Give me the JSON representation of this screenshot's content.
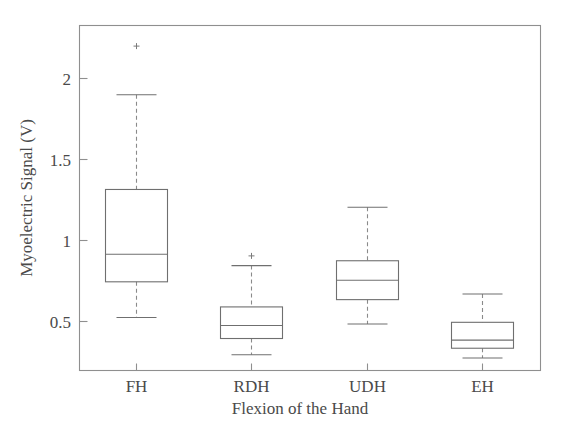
{
  "chart_data": {
    "type": "box",
    "title": "",
    "xlabel": "Flexion of the Hand",
    "ylabel": "Myoelectric Signal (V)",
    "categories": [
      "FH",
      "RDH",
      "UDH",
      "EH"
    ],
    "ytick_labels": [
      "0.5",
      "1",
      "1.5",
      "2"
    ],
    "ytick_values": [
      0.5,
      1,
      1.5,
      2
    ],
    "ylim": [
      0.2,
      2.33
    ],
    "grid": false,
    "legend": null,
    "boxes": [
      {
        "category": "FH",
        "whisker_low": 0.525,
        "q1": 0.745,
        "median": 0.915,
        "q3": 1.315,
        "whisker_high": 1.9,
        "outliers": [
          2.2
        ]
      },
      {
        "category": "RDH",
        "whisker_low": 0.295,
        "q1": 0.395,
        "median": 0.475,
        "q3": 0.59,
        "whisker_high": 0.845,
        "outliers": [
          0.905
        ]
      },
      {
        "category": "UDH",
        "whisker_low": 0.485,
        "q1": 0.635,
        "median": 0.755,
        "q3": 0.875,
        "whisker_high": 1.205,
        "outliers": []
      },
      {
        "category": "EH",
        "whisker_low": 0.275,
        "q1": 0.335,
        "median": 0.385,
        "q3": 0.495,
        "whisker_high": 0.67,
        "outliers": []
      }
    ]
  },
  "axes": {
    "y_title": "Myoelectric Signal (V)",
    "x_title": "Flexion of the Hand",
    "y_ticks": [
      {
        "label": "2",
        "value": 2
      },
      {
        "label": "1.5",
        "value": 1.5
      },
      {
        "label": "1",
        "value": 1
      },
      {
        "label": "0.5",
        "value": 0.5
      }
    ],
    "x_ticks": [
      {
        "label": "FH"
      },
      {
        "label": "RDH"
      },
      {
        "label": "UDH"
      },
      {
        "label": "EH"
      }
    ]
  },
  "colors": {
    "frame": "#8f8f8f",
    "box": "#6f6f6f",
    "whisker": "#8a8a8a",
    "text": "#4a4a4a",
    "background": "#ffffff"
  }
}
